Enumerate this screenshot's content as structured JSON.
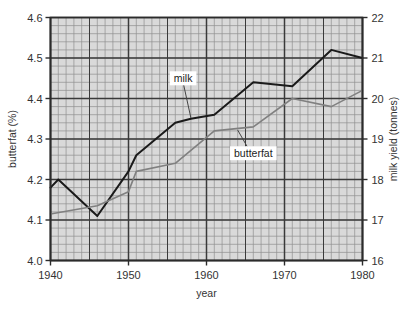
{
  "chart_data": {
    "type": "line",
    "title": "",
    "xlabel": "year",
    "ylabel": "butterfat (%)",
    "y2label": "milk yield (tonnes)",
    "xlim": [
      1940,
      1980
    ],
    "ylim": [
      4.0,
      4.6
    ],
    "y2lim": [
      16,
      22
    ],
    "xticks": [
      1940,
      1950,
      1960,
      1970,
      1980
    ],
    "xticklabels": [
      "1940",
      "1950",
      "1960",
      "1970",
      "1980"
    ],
    "yticks": [
      4.0,
      4.1,
      4.2,
      4.3,
      4.4,
      4.5,
      4.6
    ],
    "yticklabels": [
      "4.0",
      "4.1",
      "4.2",
      "4.3",
      "4.4",
      "4.5",
      "4.6"
    ],
    "y2ticks": [
      16,
      17,
      18,
      19,
      20,
      21,
      22
    ],
    "y2ticklabels": [
      "16",
      "17",
      "18",
      "19",
      "20",
      "21",
      "22"
    ],
    "grid": true,
    "grid_minor": true,
    "minor_x_step": 1,
    "minor_y_step": 0.02,
    "legend_position": "inline-annotations",
    "plot_background": "#d9d9d9",
    "series": [
      {
        "name": "milk",
        "axis": "left",
        "color": "#1a1a1a",
        "label_text": "milk",
        "x": [
          1940,
          1941,
          1946,
          1950,
          1951,
          1956,
          1958,
          1961,
          1966,
          1971,
          1976,
          1980
        ],
        "values": [
          4.18,
          4.2,
          4.11,
          4.22,
          4.26,
          4.34,
          4.35,
          4.36,
          4.44,
          4.43,
          4.52,
          4.5
        ]
      },
      {
        "name": "butterfat",
        "axis": "right",
        "color": "#808080",
        "label_text": "butterfat",
        "x": [
          1940,
          1946,
          1950,
          1951,
          1956,
          1961,
          1966,
          1971,
          1976,
          1980
        ],
        "values": [
          17.15,
          17.35,
          17.7,
          18.2,
          18.4,
          19.2,
          19.3,
          20.0,
          19.8,
          20.2
        ]
      }
    ],
    "annotations": [
      {
        "text": "milk",
        "series": "milk",
        "x": 1957,
        "y": 4.44
      },
      {
        "text": "butterfat",
        "series": "butterfat",
        "x": 1966,
        "y": 18.55
      }
    ]
  }
}
